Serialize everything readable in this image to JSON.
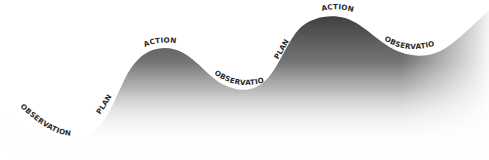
{
  "diagram": {
    "colors": {
      "background": "#ffffff",
      "wave_dark": "#3a3a3a",
      "wave_fade": "#ffffff",
      "label": "#2a2a2a"
    },
    "labels": [
      {
        "id": "observation-1",
        "text": "OBSERVATION"
      },
      {
        "id": "plan-1",
        "text": "PLAN"
      },
      {
        "id": "action-1",
        "text": "ACTION"
      },
      {
        "id": "observation-2",
        "text": "OBSERVATION"
      },
      {
        "id": "plan-2",
        "text": "PLAN"
      },
      {
        "id": "action-2",
        "text": "ACTION"
      },
      {
        "id": "observation-3",
        "text": "OBSERVATION"
      }
    ]
  }
}
